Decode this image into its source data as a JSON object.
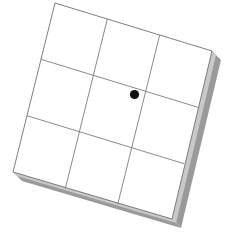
{
  "scene": {
    "title": "Rotated 3x3 grid tile with marker dot",
    "canvas": {
      "width": 232,
      "height": 234
    },
    "background_color": "#ffffff"
  },
  "tile": {
    "name": "grid-tile",
    "fill_color": "#ffffff",
    "border_color": "#6f6f6f",
    "border_width": 0.9,
    "rotation_degrees": 17,
    "corners": {
      "top_left": {
        "x": 55,
        "y": 3
      },
      "top_right": {
        "x": 212,
        "y": 51
      },
      "bottom_right": {
        "x": 172,
        "y": 219
      },
      "bottom_left": {
        "x": 13,
        "y": 172
      }
    },
    "rows": 3,
    "columns": 3
  },
  "grid_lines": {
    "name": "grid-lines",
    "color": "#7d7d7d",
    "width": 0.9,
    "vertical": [
      {
        "x1": 107.3,
        "y1": 19.0,
        "x2": 65.3,
        "y2": 188.7
      },
      {
        "x1": 159.7,
        "y1": 35.0,
        "x2": 117.7,
        "y2": 204.3
      }
    ],
    "horizontal": [
      {
        "x1": 41.0,
        "y1": 59.3,
        "x2": 198.0,
        "y2": 107.3
      },
      {
        "x1": 27.0,
        "y1": 115.7,
        "x2": 184.0,
        "y2": 163.7
      }
    ]
  },
  "shadow": {
    "name": "tile-shadow",
    "color": "#9a9a9a",
    "highlight_color": "#c9c9c9",
    "offset_x": 9,
    "offset_y": 9,
    "description": "3D slab edge along right and bottom sides"
  },
  "marker": {
    "name": "marker-dot",
    "color": "#111111",
    "center": {
      "x": 134.5,
      "y": 94.5
    },
    "radius": 4.6,
    "cell_row": 2,
    "cell_column": 2,
    "label": ""
  }
}
